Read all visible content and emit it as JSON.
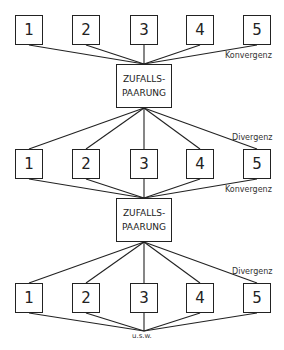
{
  "diagram": {
    "rows": [
      {
        "boxes": [
          "1",
          "2",
          "3",
          "4",
          "5"
        ]
      },
      {
        "boxes": [
          "1",
          "2",
          "3",
          "4",
          "5"
        ]
      },
      {
        "boxes": [
          "1",
          "2",
          "3",
          "4",
          "5"
        ]
      }
    ],
    "pairing_boxes": [
      {
        "line1": "ZUFALLS-",
        "line2": "PAARUNG"
      },
      {
        "line1": "ZUFALLS-",
        "line2": "PAARUNG"
      }
    ],
    "labels": {
      "convergence_1": "Konvergenz",
      "divergence_1": "Divergenz",
      "convergence_2": "Konvergenz",
      "divergence_2": "Divergenz",
      "etc": "u.s.w."
    },
    "colors": {
      "line": "#222222",
      "background": "#ffffff"
    }
  }
}
